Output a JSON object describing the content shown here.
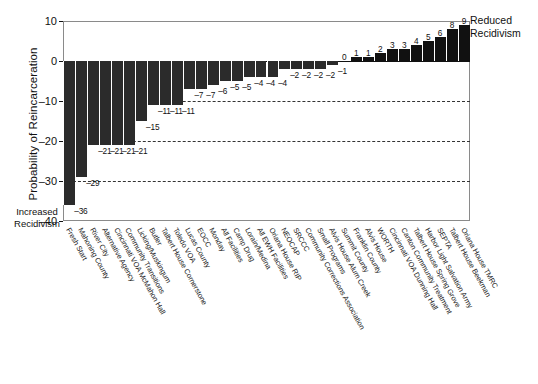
{
  "chart_data": {
    "type": "bar",
    "title": "",
    "xlabel": "",
    "ylabel": "Probability of Reincarceration",
    "ylim": [
      -40,
      10
    ],
    "yticks": [
      10,
      0,
      -10,
      -20,
      -30,
      -40
    ],
    "ytick_labels": [
      "10",
      "0",
      "-10",
      "-20",
      "-30",
      "-40"
    ],
    "gridlines": [
      -10,
      -20,
      -30
    ],
    "grid": true,
    "legend": "none",
    "annotations": {
      "top_right": "Reduced\nRecidivism",
      "top_right_line1": "Reduced",
      "top_right_line2": "Recidivism",
      "left_bottom_line1": "Increased",
      "left_bottom_line2": "Recidivism"
    },
    "categories": [
      "Fresh Start",
      "Mahoning County",
      "River City",
      "Alternative Agency",
      "Cincinnati VOA McMahon Hall",
      "Community Transitions",
      "Licking/Muskingum",
      "Butler",
      "Talbert House Cornerstone",
      "Toledo VOA",
      "Lucas County",
      "EOCC",
      "Monday",
      "All Facilities",
      "Camp Drug",
      "Lorain/Medina",
      "All EWH Facilities",
      "Oriana House RIP",
      "NEOCAP",
      "SRCCC",
      "Community Corrections Association",
      "Small Programs",
      "Alvis House Alum Creek",
      "Summit County",
      "Franklin County",
      "Alvis House",
      "WORTH",
      "Cincinnati VOA Dunning Hall",
      "Canton Community Treatment",
      "Talbert House Spring Grove",
      "Harbor Light Salvation Army",
      "SEPTA",
      "Talbert House Beekman",
      "Oriana House TMRC"
    ],
    "values": [
      -36,
      -29,
      -21,
      -21,
      -21,
      -21,
      -15,
      -11,
      -11,
      -11,
      -7,
      -7,
      -6,
      -5,
      -5,
      -4,
      -4,
      -4,
      -2,
      -2,
      -2,
      -2,
      -1,
      0,
      1,
      1,
      2,
      3,
      3,
      4,
      5,
      6,
      8,
      9
    ],
    "value_labels": [
      "-36",
      "-29",
      "-21",
      "-21",
      "-21",
      "-21",
      "-15",
      "-11",
      "-11",
      "-11",
      "-7",
      "-7",
      "-6",
      "-5",
      "-5",
      "-4",
      "-4",
      "-4",
      "-2",
      "-2",
      "-2",
      "-2",
      "-1",
      "0",
      "1",
      "1",
      "2",
      "3",
      "3",
      "4",
      "5",
      "6",
      "8",
      "9"
    ],
    "bar_color": "#2b2b2b"
  },
  "caption": ""
}
